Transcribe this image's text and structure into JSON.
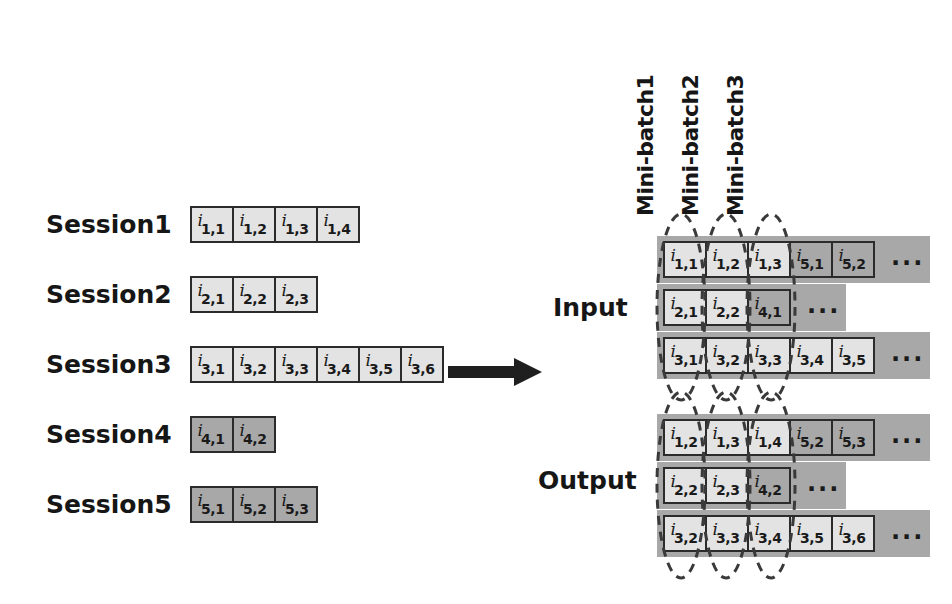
{
  "diagram": {
    "colors": {
      "cell_light": "#e3e3e3",
      "cell_dark": "#a8a8a8",
      "block_bg": "#a8a8a8",
      "stroke": "#2b2b2b",
      "text": "#161616"
    },
    "ellipsis": "...",
    "item_symbol": "i"
  },
  "sessions": [
    {
      "label": "Session1",
      "cells": [
        {
          "sym": "i",
          "sub": "1,1",
          "shade": "light"
        },
        {
          "sym": "i",
          "sub": "1,2",
          "shade": "light"
        },
        {
          "sym": "i",
          "sub": "1,3",
          "shade": "light"
        },
        {
          "sym": "i",
          "sub": "1,4",
          "shade": "light"
        }
      ]
    },
    {
      "label": "Session2",
      "cells": [
        {
          "sym": "i",
          "sub": "2,1",
          "shade": "light"
        },
        {
          "sym": "i",
          "sub": "2,2",
          "shade": "light"
        },
        {
          "sym": "i",
          "sub": "2,3",
          "shade": "light"
        }
      ]
    },
    {
      "label": "Session3",
      "cells": [
        {
          "sym": "i",
          "sub": "3,1",
          "shade": "light"
        },
        {
          "sym": "i",
          "sub": "3,2",
          "shade": "light"
        },
        {
          "sym": "i",
          "sub": "3,3",
          "shade": "light"
        },
        {
          "sym": "i",
          "sub": "3,4",
          "shade": "light"
        },
        {
          "sym": "i",
          "sub": "3,5",
          "shade": "light"
        },
        {
          "sym": "i",
          "sub": "3,6",
          "shade": "light"
        }
      ]
    },
    {
      "label": "Session4",
      "cells": [
        {
          "sym": "i",
          "sub": "4,1",
          "shade": "dark"
        },
        {
          "sym": "i",
          "sub": "4,2",
          "shade": "dark"
        }
      ]
    },
    {
      "label": "Session5",
      "cells": [
        {
          "sym": "i",
          "sub": "5,1",
          "shade": "dark"
        },
        {
          "sym": "i",
          "sub": "5,2",
          "shade": "dark"
        },
        {
          "sym": "i",
          "sub": "5,3",
          "shade": "dark"
        }
      ]
    }
  ],
  "batch_labels": [
    "Mini-batch1",
    "Mini-batch2",
    "Mini-batch3"
  ],
  "input_block": {
    "label": "Input",
    "rows": [
      {
        "cells": [
          {
            "sym": "i",
            "sub": "1,1",
            "shade": "light"
          },
          {
            "sym": "i",
            "sub": "1,2",
            "shade": "light"
          },
          {
            "sym": "i",
            "sub": "1,3",
            "shade": "light"
          },
          {
            "sym": "i",
            "sub": "5,1",
            "shade": "dark"
          },
          {
            "sym": "i",
            "sub": "5,2",
            "shade": "dark"
          }
        ],
        "dots": "..."
      },
      {
        "cells": [
          {
            "sym": "i",
            "sub": "2,1",
            "shade": "light"
          },
          {
            "sym": "i",
            "sub": "2,2",
            "shade": "light"
          },
          {
            "sym": "i",
            "sub": "4,1",
            "shade": "dark"
          }
        ],
        "dots": "..."
      },
      {
        "cells": [
          {
            "sym": "i",
            "sub": "3,1",
            "shade": "light"
          },
          {
            "sym": "i",
            "sub": "3,2",
            "shade": "light"
          },
          {
            "sym": "i",
            "sub": "3,3",
            "shade": "light"
          },
          {
            "sym": "i",
            "sub": "3,4",
            "shade": "light"
          },
          {
            "sym": "i",
            "sub": "3,5",
            "shade": "light"
          }
        ],
        "dots": "..."
      }
    ]
  },
  "output_block": {
    "label": "Output",
    "rows": [
      {
        "cells": [
          {
            "sym": "i",
            "sub": "1,2",
            "shade": "light"
          },
          {
            "sym": "i",
            "sub": "1,3",
            "shade": "light"
          },
          {
            "sym": "i",
            "sub": "1,4",
            "shade": "light"
          },
          {
            "sym": "i",
            "sub": "5,2",
            "shade": "dark"
          },
          {
            "sym": "i",
            "sub": "5,3",
            "shade": "dark"
          }
        ],
        "dots": "..."
      },
      {
        "cells": [
          {
            "sym": "i",
            "sub": "2,2",
            "shade": "light"
          },
          {
            "sym": "i",
            "sub": "2,3",
            "shade": "light"
          },
          {
            "sym": "i",
            "sub": "4,2",
            "shade": "dark"
          }
        ],
        "dots": "..."
      },
      {
        "cells": [
          {
            "sym": "i",
            "sub": "3,2",
            "shade": "light"
          },
          {
            "sym": "i",
            "sub": "3,3",
            "shade": "light"
          },
          {
            "sym": "i",
            "sub": "3,4",
            "shade": "light"
          },
          {
            "sym": "i",
            "sub": "3,5",
            "shade": "light"
          },
          {
            "sym": "i",
            "sub": "3,6",
            "shade": "light"
          }
        ],
        "dots": "..."
      }
    ]
  }
}
